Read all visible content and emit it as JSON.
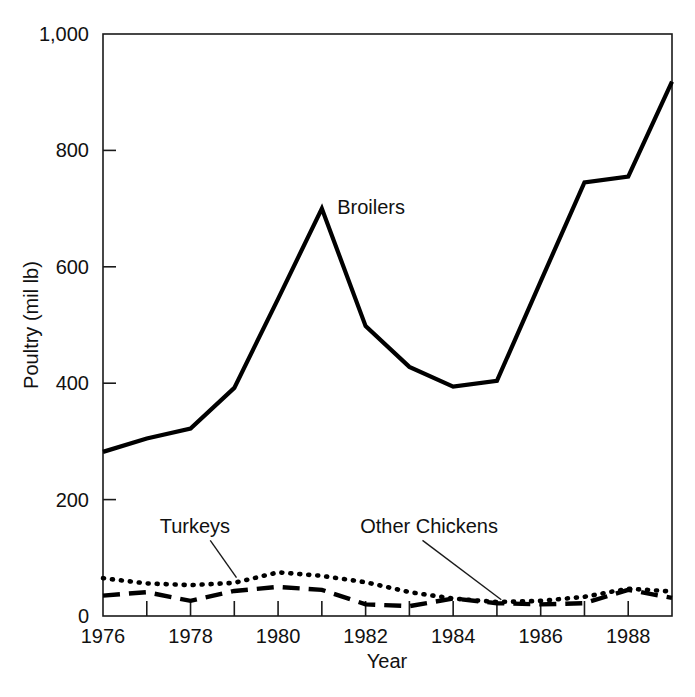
{
  "chart_data": {
    "type": "line",
    "title": "",
    "xlabel": "Year",
    "ylabel": "Poultry (mil lb)",
    "xlim": [
      1976,
      1989
    ],
    "ylim": [
      0,
      1000
    ],
    "grid": false,
    "legend_position": "inline-annotations",
    "x_tick_labels": [
      "1976",
      "1978",
      "1980",
      "1982",
      "1984",
      "1986",
      "1988"
    ],
    "x_tick_values": [
      1976,
      1978,
      1980,
      1982,
      1984,
      1986,
      1988
    ],
    "x_minor_ticks": [
      1977,
      1979,
      1981,
      1983,
      1985,
      1987,
      1989
    ],
    "y_tick_labels": [
      "0",
      "200",
      "400",
      "600",
      "800",
      "1,000"
    ],
    "y_tick_values": [
      0,
      200,
      400,
      600,
      800,
      1000
    ],
    "x": [
      1976,
      1977,
      1978,
      1979,
      1980,
      1981,
      1982,
      1983,
      1984,
      1985,
      1986,
      1987,
      1988,
      1989
    ],
    "series": [
      {
        "name": "Broilers",
        "style": "solid",
        "color": "#000000",
        "values": [
          282,
          305,
          322,
          392,
          545,
          700,
          498,
          428,
          394,
          404,
          575,
          745,
          755,
          918
        ]
      },
      {
        "name": "Turkeys",
        "style": "dotted",
        "color": "#000000",
        "values": [
          65,
          56,
          53,
          57,
          75,
          69,
          58,
          41,
          30,
          24,
          26,
          33,
          47,
          42
        ]
      },
      {
        "name": "Other Chickens",
        "style": "dashed",
        "color": "#000000",
        "values": [
          35,
          41,
          26,
          43,
          50,
          45,
          20,
          17,
          30,
          22,
          20,
          22,
          45,
          31
        ]
      }
    ],
    "annotations": [
      {
        "text": "Broilers",
        "x": 1981.35,
        "y": 690,
        "anchor": "start",
        "leader": false
      },
      {
        "text": "Turkeys",
        "x": 1978.1,
        "y": 143,
        "anchor": "middle",
        "leader": true,
        "leader_from": [
          1978.45,
          130
        ],
        "leader_to": [
          1979.05,
          66
        ]
      },
      {
        "text": "Other Chickens",
        "x": 1983.45,
        "y": 143,
        "anchor": "middle",
        "leader": true,
        "leader_from": [
          1983.3,
          130
        ],
        "leader_to": [
          1985.1,
          28
        ]
      }
    ]
  },
  "axes": {
    "frame_color": "#1a1a1a",
    "axis_title_x": "Year",
    "axis_title_y": "Poultry (mil lb)"
  }
}
